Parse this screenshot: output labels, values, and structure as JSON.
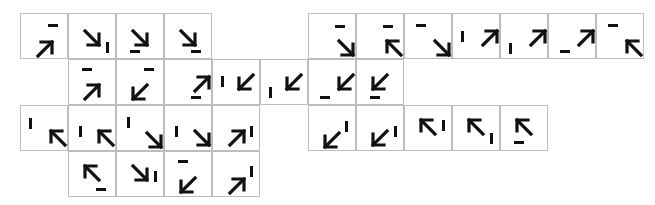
{
  "grid": {
    "origin_x": 20,
    "origin_y": 13,
    "cell_w": 48,
    "cell_h": 46,
    "border_color": "#bdbdbd",
    "ink_color": "#111111"
  },
  "tiles": [
    {
      "row": 0,
      "col": 0,
      "arrow": "ne",
      "ax": 17,
      "ay": 28,
      "bar": "h",
      "bx": 27,
      "by": 10
    },
    {
      "row": 0,
      "col": 1,
      "arrow": "se",
      "ax": 16,
      "ay": 17,
      "bar": "v",
      "bx": 37,
      "by": 28
    },
    {
      "row": 0,
      "col": 2,
      "arrow": "se",
      "ax": 16,
      "ay": 17,
      "bar": "h",
      "bx": 13,
      "by": 36
    },
    {
      "row": 0,
      "col": 3,
      "arrow": "se",
      "ax": 16,
      "ay": 17,
      "bar": "h",
      "bx": 26,
      "by": 36
    },
    {
      "row": 0,
      "col": 6,
      "arrow": "se",
      "ax": 30,
      "ay": 27,
      "bar": "h",
      "bx": 26,
      "by": 11
    },
    {
      "row": 0,
      "col": 7,
      "arrow": "nw",
      "ax": 30,
      "ay": 27,
      "bar": "h",
      "bx": 26,
      "by": 11
    },
    {
      "row": 0,
      "col": 8,
      "arrow": "se",
      "ax": 30,
      "ay": 27,
      "bar": "h",
      "bx": 11,
      "by": 10
    },
    {
      "row": 0,
      "col": 9,
      "arrow": "ne",
      "ax": 30,
      "ay": 17,
      "bar": "v",
      "bx": 8,
      "by": 17
    },
    {
      "row": 0,
      "col": 10,
      "arrow": "ne",
      "ax": 30,
      "ay": 17,
      "bar": "v",
      "bx": 8,
      "by": 29
    },
    {
      "row": 0,
      "col": 11,
      "arrow": "ne",
      "ax": 30,
      "ay": 17,
      "bar": "h",
      "bx": 11,
      "by": 36
    },
    {
      "row": 0,
      "col": 12,
      "arrow": "nw",
      "ax": 30,
      "ay": 27,
      "bar": "h",
      "bx": 11,
      "by": 10
    },
    {
      "row": 1,
      "col": 1,
      "arrow": "ne",
      "ax": 16,
      "ay": 25,
      "bar": "h",
      "bx": 13,
      "by": 8
    },
    {
      "row": 1,
      "col": 2,
      "arrow": "sw",
      "ax": 16,
      "ay": 25,
      "bar": "h",
      "bx": 27,
      "by": 8
    },
    {
      "row": 1,
      "col": 3,
      "arrow": "ne",
      "ax": 30,
      "ay": 17,
      "bar": "h",
      "bx": 26,
      "by": 36
    },
    {
      "row": 1,
      "col": 4,
      "arrow": "sw",
      "ax": 26,
      "ay": 15,
      "bar": "v",
      "bx": 8,
      "by": 16
    },
    {
      "row": 1,
      "col": 5,
      "arrow": "sw",
      "ax": 26,
      "ay": 15,
      "bar": "v",
      "bx": 8,
      "by": 27
    },
    {
      "row": 1,
      "col": 6,
      "arrow": "sw",
      "ax": 30,
      "ay": 15,
      "bar": "h",
      "bx": 11,
      "by": 36
    },
    {
      "row": 1,
      "col": 7,
      "arrow": "sw",
      "ax": 16,
      "ay": 15,
      "bar": "h",
      "bx": 13,
      "by": 36
    },
    {
      "row": 2,
      "col": 0,
      "arrow": "nw",
      "ax": 30,
      "ay": 25,
      "bar": "v",
      "bx": 8,
      "by": 12
    },
    {
      "row": 2,
      "col": 1,
      "arrow": "nw",
      "ax": 30,
      "ay": 25,
      "bar": "v",
      "bx": 10,
      "by": 20
    },
    {
      "row": 2,
      "col": 2,
      "arrow": "se",
      "ax": 30,
      "ay": 27,
      "bar": "v",
      "bx": 10,
      "by": 11
    },
    {
      "row": 2,
      "col": 3,
      "arrow": "se",
      "ax": 30,
      "ay": 25,
      "bar": "v",
      "bx": 10,
      "by": 20
    },
    {
      "row": 2,
      "col": 4,
      "arrow": "ne",
      "ax": 17,
      "ay": 25,
      "bar": "v",
      "bx": 37,
      "by": 20
    },
    {
      "row": 2,
      "col": 6,
      "arrow": "sw",
      "ax": 16,
      "ay": 27,
      "bar": "v",
      "bx": 36,
      "by": 15
    },
    {
      "row": 2,
      "col": 7,
      "arrow": "sw",
      "ax": 16,
      "ay": 25,
      "bar": "v",
      "bx": 37,
      "by": 20
    },
    {
      "row": 2,
      "col": 8,
      "arrow": "nw",
      "ax": 16,
      "ay": 14,
      "bar": "v",
      "bx": 37,
      "by": 14
    },
    {
      "row": 2,
      "col": 9,
      "arrow": "nw",
      "ax": 16,
      "ay": 14,
      "bar": "v",
      "bx": 37,
      "by": 27
    },
    {
      "row": 2,
      "col": 10,
      "arrow": "nw",
      "ax": 16,
      "ay": 14,
      "bar": "h",
      "bx": 13,
      "by": 35
    },
    {
      "row": 3,
      "col": 1,
      "arrow": "nw",
      "ax": 16,
      "ay": 14,
      "bar": "h",
      "bx": 27,
      "by": 36
    },
    {
      "row": 3,
      "col": 2,
      "arrow": "se",
      "ax": 16,
      "ay": 14,
      "bar": "v",
      "bx": 37,
      "by": 19
    },
    {
      "row": 3,
      "col": 3,
      "arrow": "sw",
      "ax": 16,
      "ay": 26,
      "bar": "h",
      "bx": 13,
      "by": 8
    },
    {
      "row": 3,
      "col": 4,
      "arrow": "ne",
      "ax": 17,
      "ay": 27,
      "bar": "v",
      "bx": 37,
      "by": 14
    }
  ]
}
